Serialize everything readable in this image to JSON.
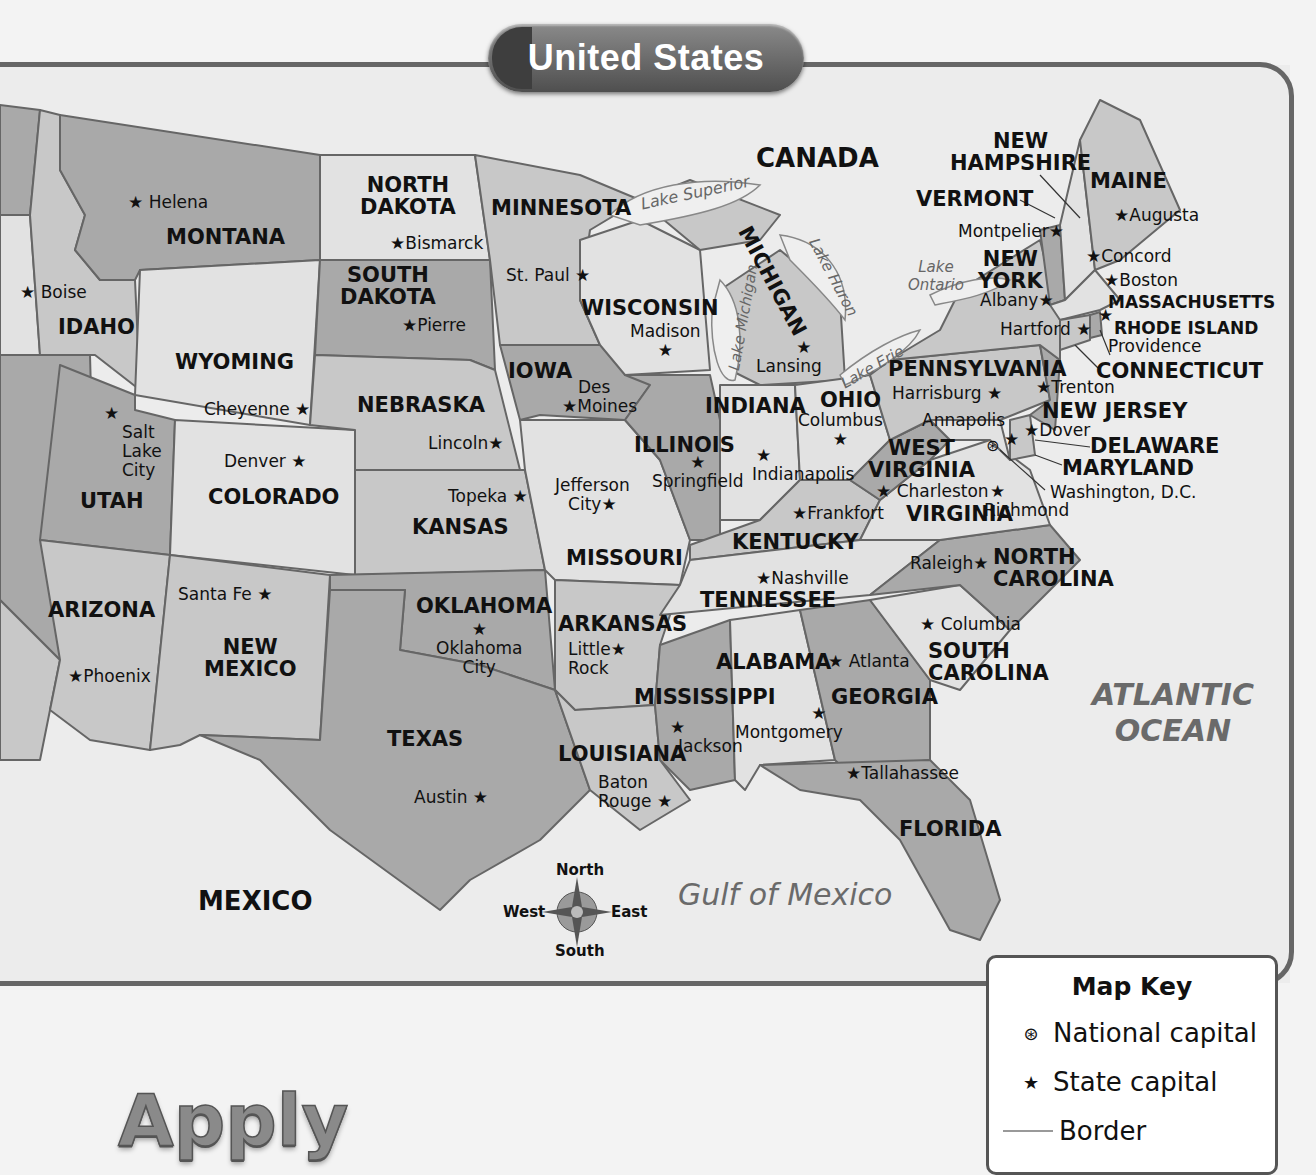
{
  "title": "United States",
  "colors": {
    "background": "#f3f3f3",
    "land_light": "#e2e2e2",
    "land_mid": "#c8c8c8",
    "land_dark": "#a9a9a9",
    "water": "#efefef",
    "border": "#666666",
    "banner": "#5e5e5e"
  },
  "countries": {
    "canada": "CANADA",
    "mexico": "MEXICO"
  },
  "water_bodies": {
    "atlantic_1": "ATLANTIC",
    "atlantic_2": "OCEAN",
    "gulf": "Gulf of Mexico",
    "lake_superior": "Lake Superior",
    "lake_michigan": "Lake Michigan",
    "lake_huron": "Lake Huron",
    "lake_erie": "Lake Erie",
    "lake_ontario_1": "Lake",
    "lake_ontario_2": "Ontario"
  },
  "states": {
    "montana": "MONTANA",
    "idaho": "IDAHO",
    "wyoming": "WYOMING",
    "utah": "UTAH",
    "colorado": "COLORADO",
    "arizona": "ARIZONA",
    "new_mexico_1": "NEW",
    "new_mexico_2": "MEXICO",
    "north_dakota_1": "NORTH",
    "north_dakota_2": "DAKOTA",
    "south_dakota_1": "SOUTH",
    "south_dakota_2": "DAKOTA",
    "nebraska": "NEBRASKA",
    "kansas": "KANSAS",
    "oklahoma": "OKLAHOMA",
    "texas": "TEXAS",
    "minnesota": "MINNESOTA",
    "iowa": "IOWA",
    "missouri": "MISSOURI",
    "arkansas": "ARKANSAS",
    "louisiana": "LOUISIANA",
    "wisconsin": "WISCONSIN",
    "illinois": "ILLINOIS",
    "michigan": "MICHIGAN",
    "indiana": "INDIANA",
    "ohio": "OHIO",
    "kentucky": "KENTUCKY",
    "tennessee": "TENNESSEE",
    "mississippi": "MISSISSIPPI",
    "alabama": "ALABAMA",
    "georgia": "GEORGIA",
    "florida": "FLORIDA",
    "south_carolina_1": "SOUTH",
    "south_carolina_2": "CAROLINA",
    "north_carolina_1": "NORTH",
    "north_carolina_2": "CAROLINA",
    "virginia": "VIRGINIA",
    "west_virginia_1": "WEST",
    "west_virginia_2": "VIRGINIA",
    "pennsylvania": "PENNSYLVANIA",
    "new_york_1": "NEW",
    "new_york_2": "YORK",
    "vermont": "VERMONT",
    "new_hampshire_1": "NEW",
    "new_hampshire_2": "HAMPSHIRE",
    "maine": "MAINE",
    "massachusetts": "MASSACHUSETTS",
    "rhode_island": "RHODE ISLAND",
    "connecticut": "CONNECTICUT",
    "new_jersey": "NEW JERSEY",
    "delaware": "DELAWARE",
    "maryland": "MARYLAND"
  },
  "capitals": {
    "helena": "Helena",
    "boise": "Boise",
    "cheyenne": "Cheyenne",
    "salt_lake_1": "Salt",
    "salt_lake_2": "Lake",
    "salt_lake_3": "City",
    "denver": "Denver",
    "santa_fe": "Santa Fe",
    "phoenix": "Phoenix",
    "bismarck": "Bismarck",
    "pierre": "Pierre",
    "lincoln": "Lincoln",
    "topeka": "Topeka",
    "oklahoma_city_1": "Oklahoma",
    "oklahoma_city_2": "City",
    "austin": "Austin",
    "st_paul": "St. Paul",
    "des_moines_1": "Des",
    "des_moines_2": "Moines",
    "jefferson_city_1": "Jefferson",
    "jefferson_city_2": "City",
    "little_rock_1": "Little",
    "little_rock_2": "Rock",
    "baton_rouge_1": "Baton",
    "baton_rouge_2": "Rouge",
    "madison": "Madison",
    "springfield": "Springfield",
    "lansing": "Lansing",
    "indianapolis": "Indianapolis",
    "columbus_oh": "Columbus",
    "frankfort": "Frankfort",
    "nashville": "Nashville",
    "jackson": "Jackson",
    "montgomery": "Montgomery",
    "atlanta": "Atlanta",
    "tallahassee": "Tallahassee",
    "columbia": "Columbia",
    "raleigh": "Raleigh",
    "richmond": "Richmond",
    "charleston": "Charleston",
    "harrisburg": "Harrisburg",
    "albany": "Albany",
    "montpelier": "Montpelier",
    "concord": "Concord",
    "augusta": "Augusta",
    "boston": "Boston",
    "providence": "Providence",
    "hartford": "Hartford",
    "trenton": "Trenton",
    "dover": "Dover",
    "annapolis": "Annapolis",
    "washington_dc": "Washington, D.C."
  },
  "compass": {
    "north": "North",
    "south": "South",
    "east": "East",
    "west": "West"
  },
  "map_key": {
    "title": "Map Key",
    "items": [
      {
        "symbol": "⊛",
        "label": "National capital"
      },
      {
        "symbol": "★",
        "label": "State capital"
      },
      {
        "symbol": "line",
        "label": "Border"
      }
    ]
  },
  "section_heading": "Apply"
}
